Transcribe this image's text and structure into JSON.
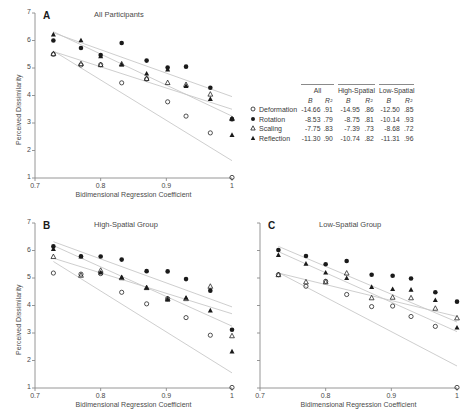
{
  "figure": {
    "width": 465,
    "height": 420,
    "axis_label_x": "Bidimensional Regression Coefficient",
    "axis_label_y": "Perceived Dissimilarity",
    "xticks": [
      "0.7",
      "0.8",
      "0.9",
      "1"
    ],
    "yticks": [
      "7",
      "6",
      "5",
      "4",
      "3",
      "2",
      "1"
    ]
  },
  "panels": [
    {
      "letter": "A",
      "title": "All Participants"
    },
    {
      "letter": "B",
      "title": "High-Spatial Group"
    },
    {
      "letter": "C",
      "title": "Low-Spatial Group"
    }
  ],
  "legend": {
    "groups": [
      "All",
      "High-Spatial",
      "Low-Spatial"
    ],
    "subheaders": [
      "B",
      "R²"
    ],
    "rows": [
      {
        "marker": "open-circle",
        "label": "Deformation",
        "all_B": "-14.66",
        "all_R2": ".91",
        "high_B": "-14.95",
        "high_R2": ".86",
        "low_B": "-12.50",
        "low_R2": ".85"
      },
      {
        "marker": "filled-circle",
        "label": "Rotation",
        "all_B": "-8.53",
        "all_R2": ".79",
        "high_B": "-8.75",
        "high_R2": ".81",
        "low_B": "-10.14",
        "low_R2": ".93"
      },
      {
        "marker": "open-triangle",
        "label": "Scaling",
        "all_B": "-7.75",
        "all_R2": ".83",
        "high_B": "-7.39",
        "high_R2": ".73",
        "low_B": "-8.68",
        "low_R2": ".72"
      },
      {
        "marker": "filled-triangle",
        "label": "Reflection",
        "all_B": "-11.30",
        "all_R2": ".90",
        "high_B": "-10.74",
        "high_R2": ".82",
        "low_B": "-11.31",
        "low_R2": ".96"
      }
    ]
  },
  "colors": {
    "axis": "#8a8a8a",
    "marker": "#1a1a1a",
    "fitline": "#c8c8c8",
    "text": "#3a3a3a"
  },
  "chart_data": {
    "type": "scatter",
    "xlabel": "Bidimensional Regression Coefficient",
    "ylabel": "Perceived Dissimilarity",
    "xlim": [
      0.7,
      1.0
    ],
    "ylim": [
      1,
      7
    ],
    "grid": false,
    "legend_position": "right-middle",
    "panels": [
      {
        "letter": "A",
        "title": "All Participants",
        "series": [
          {
            "name": "Deformation",
            "marker": "open-circle",
            "x": [
              0.728,
              0.77,
              0.8,
              0.832,
              0.87,
              0.902,
              0.93,
              0.967,
              1.0
            ],
            "y": [
              5.5,
              5.11,
              5.12,
              4.46,
              4.6,
              3.77,
              3.25,
              2.64,
              1.02
            ],
            "fit": {
              "slope": -14.66,
              "r2": 0.91,
              "x0": 0.728,
              "y0": 5.62,
              "x1": 1.0,
              "y1": 1.63
            }
          },
          {
            "name": "Rotation",
            "marker": "filled-circle",
            "x": [
              0.728,
              0.77,
              0.8,
              0.832,
              0.87,
              0.902,
              0.93,
              0.967,
              1.0
            ],
            "y": [
              6.0,
              5.73,
              5.47,
              5.91,
              5.27,
              5.02,
              5.05,
              4.28,
              3.14
            ],
            "fit": {
              "slope": -8.53,
              "r2": 0.79,
              "x0": 0.728,
              "y0": 6.28,
              "x1": 1.0,
              "y1": 3.96
            }
          },
          {
            "name": "Scaling",
            "marker": "open-triangle",
            "x": [
              0.728,
              0.77,
              0.8,
              0.832,
              0.87,
              0.902,
              0.93,
              0.967,
              1.0
            ],
            "y": [
              5.52,
              5.16,
              5.12,
              5.15,
              4.62,
              4.47,
              4.4,
              4.05,
              3.16
            ],
            "fit": {
              "slope": -7.75,
              "r2": 0.83,
              "x0": 0.728,
              "y0": 5.6,
              "x1": 1.0,
              "y1": 3.5
            }
          },
          {
            "name": "Reflection",
            "marker": "filled-triangle",
            "x": [
              0.728,
              0.77,
              0.8,
              0.832,
              0.87,
              0.902,
              0.93,
              0.967,
              1.0
            ],
            "y": [
              6.22,
              6.01,
              5.43,
              5.13,
              4.8,
              4.95,
              4.35,
              3.88,
              2.57
            ],
            "fit": {
              "slope": -11.3,
              "r2": 0.9,
              "x0": 0.728,
              "y0": 6.32,
              "x1": 1.0,
              "y1": 3.25
            }
          }
        ]
      },
      {
        "letter": "B",
        "title": "High-Spatial Group",
        "series": [
          {
            "name": "Deformation",
            "marker": "open-circle",
            "x": [
              0.728,
              0.77,
              0.8,
              0.832,
              0.87,
              0.902,
              0.93,
              0.967,
              1.0
            ],
            "y": [
              5.18,
              5.14,
              5.16,
              4.48,
              4.06,
              4.25,
              3.56,
              2.92,
              1.02
            ],
            "fit": {
              "slope": -14.95,
              "r2": 0.86,
              "x0": 0.728,
              "y0": 5.6,
              "x1": 1.0,
              "y1": 1.55
            }
          },
          {
            "name": "Rotation",
            "marker": "filled-circle",
            "x": [
              0.728,
              0.77,
              0.8,
              0.832,
              0.87,
              0.902,
              0.93,
              0.967,
              1.0
            ],
            "y": [
              6.15,
              5.79,
              5.78,
              5.67,
              5.25,
              5.24,
              4.96,
              4.54,
              3.12
            ],
            "fit": {
              "slope": -8.75,
              "r2": 0.81,
              "x0": 0.728,
              "y0": 6.32,
              "x1": 1.0,
              "y1": 3.95
            }
          },
          {
            "name": "Scaling",
            "marker": "open-triangle",
            "x": [
              0.728,
              0.77,
              0.8,
              0.832,
              0.87,
              0.902,
              0.93,
              0.967,
              1.0
            ],
            "y": [
              5.78,
              5.1,
              5.28,
              5.01,
              4.65,
              4.24,
              4.25,
              4.7,
              2.9
            ],
            "fit": {
              "slope": -7.39,
              "r2": 0.73,
              "x0": 0.728,
              "y0": 5.72,
              "x1": 1.0,
              "y1": 3.7
            }
          },
          {
            "name": "Reflection",
            "marker": "filled-triangle",
            "x": [
              0.728,
              0.77,
              0.8,
              0.832,
              0.87,
              0.902,
              0.93,
              0.967,
              1.0
            ],
            "y": [
              6.06,
              5.79,
              5.2,
              5.03,
              4.65,
              4.22,
              4.29,
              3.82,
              2.33
            ],
            "fit": {
              "slope": -10.74,
              "r2": 0.82,
              "x0": 0.728,
              "y0": 6.18,
              "x1": 1.0,
              "y1": 3.25
            }
          }
        ]
      },
      {
        "letter": "C",
        "title": "Low-Spatial Group",
        "series": [
          {
            "name": "Deformation",
            "marker": "open-circle",
            "x": [
              0.728,
              0.77,
              0.8,
              0.832,
              0.87,
              0.902,
              0.93,
              0.967,
              1.0
            ],
            "y": [
              5.12,
              4.7,
              4.88,
              4.4,
              3.96,
              3.98,
              3.6,
              3.24,
              1.02
            ],
            "fit": {
              "slope": -12.5,
              "r2": 0.85,
              "x0": 0.728,
              "y0": 5.2,
              "x1": 1.0,
              "y1": 1.8
            }
          },
          {
            "name": "Rotation",
            "marker": "filled-circle",
            "x": [
              0.728,
              0.77,
              0.8,
              0.832,
              0.87,
              0.902,
              0.93,
              0.967,
              1.0
            ],
            "y": [
              6.02,
              5.8,
              5.5,
              5.62,
              5.12,
              5.08,
              4.98,
              4.48,
              4.14
            ],
            "fit": {
              "slope": -10.14,
              "r2": 0.93,
              "x0": 0.728,
              "y0": 6.15,
              "x1": 1.0,
              "y1": 3.4
            }
          },
          {
            "name": "Scaling",
            "marker": "open-triangle",
            "x": [
              0.728,
              0.77,
              0.8,
              0.832,
              0.87,
              0.902,
              0.93,
              0.967,
              1.0
            ],
            "y": [
              5.12,
              4.86,
              4.86,
              5.18,
              4.28,
              4.3,
              4.28,
              3.9,
              3.55
            ],
            "fit": {
              "slope": -8.68,
              "r2": 0.72,
              "x0": 0.728,
              "y0": 5.18,
              "x1": 1.0,
              "y1": 3.6
            }
          },
          {
            "name": "Reflection",
            "marker": "filled-triangle",
            "x": [
              0.728,
              0.77,
              0.8,
              0.832,
              0.87,
              0.902,
              0.93,
              0.967,
              1.0
            ],
            "y": [
              5.84,
              5.52,
              5.2,
              5.0,
              4.68,
              4.6,
              4.58,
              4.2,
              3.2
            ],
            "fit": {
              "slope": -11.31,
              "r2": 0.96,
              "x0": 0.728,
              "y0": 5.96,
              "x1": 1.0,
              "y1": 3.05
            }
          }
        ]
      }
    ]
  }
}
